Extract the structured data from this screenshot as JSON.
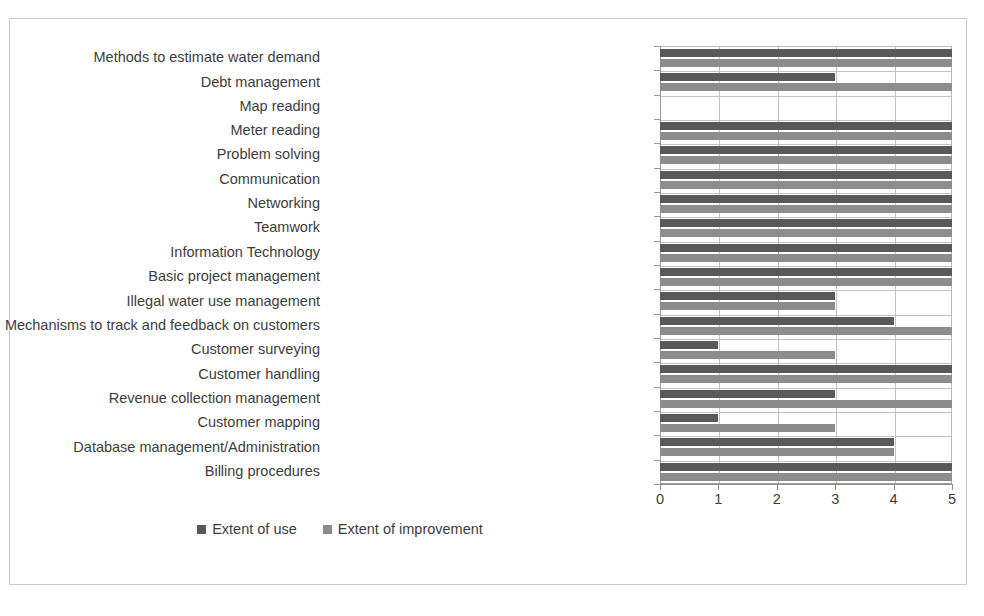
{
  "chart_data": {
    "type": "bar",
    "orientation": "horizontal",
    "title": "",
    "subtitle": "",
    "xlabel": "",
    "ylabel": "",
    "xlim": [
      0,
      5
    ],
    "xticks": [
      "0",
      "1",
      "2",
      "3",
      "4",
      "5"
    ],
    "grid": true,
    "legend_position": "bottom",
    "categories": [
      "Methods to estimate water demand",
      "Debt management",
      "Map reading",
      "Meter reading",
      "Problem solving",
      "Communication",
      "Networking",
      "Teamwork",
      "Information Technology",
      "Basic project management",
      "Illegal water use management",
      "Mechanisms to track and feedback on customers",
      "Customer surveying",
      "Customer handling",
      "Revenue collection management",
      "Customer mapping",
      "Database management/Administration",
      "Billing procedures"
    ],
    "series": [
      {
        "name": "Extent of use",
        "color": "#595959",
        "values": [
          5,
          3,
          0,
          5,
          5,
          5,
          5,
          5,
          5,
          5,
          3,
          4,
          1,
          5,
          3,
          1,
          4,
          5
        ]
      },
      {
        "name": "Extent of improvement",
        "color": "#8c8c8c",
        "values": [
          5,
          5,
          0,
          5,
          5,
          5,
          5,
          5,
          5,
          5,
          3,
          5,
          3,
          5,
          5,
          3,
          4,
          5
        ]
      }
    ]
  },
  "legend": {
    "items": [
      {
        "label": "Extent of use",
        "color": "#595959"
      },
      {
        "label": "Extent of improvement",
        "color": "#8c8c8c"
      }
    ]
  },
  "colors": {
    "series_use": "#595959",
    "series_improvement": "#8c8c8c",
    "grid": "#c2c2c2",
    "axis": "#8f8f8f",
    "frame": "#c9c9c9",
    "text": "#3d3d3d",
    "background": "#ffffff"
  }
}
